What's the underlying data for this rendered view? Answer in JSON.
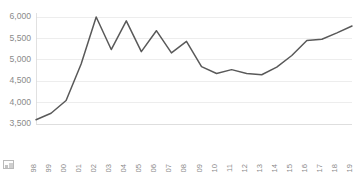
{
  "chart_data": {
    "type": "line",
    "title": "",
    "subtitle": "",
    "xlabel": "",
    "ylabel": "",
    "x": [
      1998,
      1999,
      2000,
      2001,
      2002,
      2003,
      2004,
      2005,
      2006,
      2007,
      2008,
      2009,
      2010,
      2011,
      2012,
      2013,
      2014,
      2015,
      2016,
      2017,
      2018,
      2019
    ],
    "categories": [
      "1998",
      "1999",
      "2000",
      "2001",
      "2002",
      "2003",
      "2004",
      "2005",
      "2006",
      "2007",
      "2008",
      "2009",
      "2010",
      "2011",
      "2012",
      "2013",
      "2014",
      "2015",
      "2016",
      "2017",
      "2018",
      "2019"
    ],
    "values": [
      3600,
      3750,
      4050,
      4900,
      6000,
      5240,
      5910,
      5190,
      5680,
      5160,
      5430,
      4840,
      4680,
      4770,
      4680,
      4650,
      4830,
      5100,
      5450,
      5480,
      5630,
      5790
    ],
    "series": [
      {
        "name": "series-1",
        "color": "#595959",
        "values": [
          3600,
          3750,
          4050,
          4900,
          6000,
          5240,
          5910,
          5190,
          5680,
          5160,
          5430,
          4840,
          4680,
          4770,
          4680,
          4650,
          4830,
          5100,
          5450,
          5480,
          5630,
          5790
        ]
      }
    ],
    "ylim": [
      3500,
      6000
    ],
    "yticks": [
      3500,
      4000,
      4500,
      5000,
      5500,
      6000
    ],
    "ytick_labels": [
      "3,500",
      "4,000",
      "4,500",
      "5,000",
      "5,500",
      "6,000"
    ],
    "xtick_labels": [
      "1998",
      "1999",
      "2000",
      "2001",
      "2002",
      "2003",
      "2004",
      "2005",
      "2006",
      "2007",
      "2008",
      "2009",
      "2010",
      "2011",
      "2012",
      "2013",
      "2014",
      "2015",
      "2016",
      "2017",
      "2018",
      "2019"
    ],
    "grid": true,
    "grid_axis": "y",
    "legend": false,
    "legend_position": "none",
    "annotations": [],
    "colors": {
      "line": "#595959",
      "gridline": "#e8e8e8",
      "axis": "#d9d9d9",
      "tick_label": "#8a8a8a",
      "background": "#ffffff"
    },
    "xtick_rotation": 90
  },
  "figure": {
    "broken_image_icon": "broken-image-icon"
  }
}
